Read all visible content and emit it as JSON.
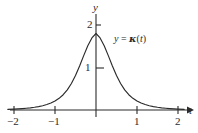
{
  "figure": {
    "name": "bell-curve-plot",
    "background_color": "#ffffff",
    "ink_color": "#2b2b2b"
  },
  "axes": {
    "y_axis_label": "y",
    "x_axis_label": "t",
    "x_ticks": [
      "−2",
      "−1",
      "1",
      "2"
    ],
    "y_ticks": [
      "1",
      "2"
    ]
  },
  "annotations": {
    "curve_label_lhs": "y",
    "curve_label_eq": " = ",
    "curve_label_fn": "κ",
    "curve_label_arg_open": "(",
    "curve_label_arg": "t",
    "curve_label_arg_close": ")"
  },
  "chart_data": {
    "type": "line",
    "title": "",
    "xlabel": "t",
    "ylabel": "y",
    "xlim": [
      -2.15,
      2.25
    ],
    "ylim": [
      -0.08,
      2.3
    ],
    "grid": false,
    "legend": "none",
    "xticks": [
      -2,
      -1,
      1,
      2
    ],
    "xticklabels": [
      "−2",
      "−1",
      "1",
      "2"
    ],
    "yticks": [
      1,
      2
    ],
    "yticklabels": [
      "1",
      "2"
    ],
    "series": [
      {
        "name": "y = κ(t)",
        "x": [
          -2.15,
          -2.0,
          -1.9,
          -1.8,
          -1.7,
          -1.6,
          -1.5,
          -1.4,
          -1.3,
          -1.2,
          -1.1,
          -1.0,
          -0.9,
          -0.8,
          -0.7,
          -0.6,
          -0.5,
          -0.4,
          -0.3,
          -0.2,
          -0.1,
          0.0,
          0.1,
          0.2,
          0.3,
          0.4,
          0.5,
          0.6,
          0.7,
          0.8,
          0.9,
          1.0,
          1.1,
          1.2,
          1.3,
          1.4,
          1.5,
          1.6,
          1.7,
          1.8,
          1.9,
          2.0,
          2.15
        ],
        "y": [
          0.015,
          0.022,
          0.027,
          0.033,
          0.041,
          0.051,
          0.064,
          0.08,
          0.101,
          0.128,
          0.164,
          0.212,
          0.275,
          0.36,
          0.474,
          0.623,
          0.812,
          1.036,
          1.28,
          1.514,
          1.696,
          1.8,
          1.696,
          1.514,
          1.28,
          1.036,
          0.812,
          0.623,
          0.474,
          0.36,
          0.275,
          0.212,
          0.164,
          0.128,
          0.101,
          0.08,
          0.064,
          0.051,
          0.041,
          0.033,
          0.027,
          0.022,
          0.015
        ]
      }
    ],
    "peak_value": 2,
    "peak_at": 0
  }
}
